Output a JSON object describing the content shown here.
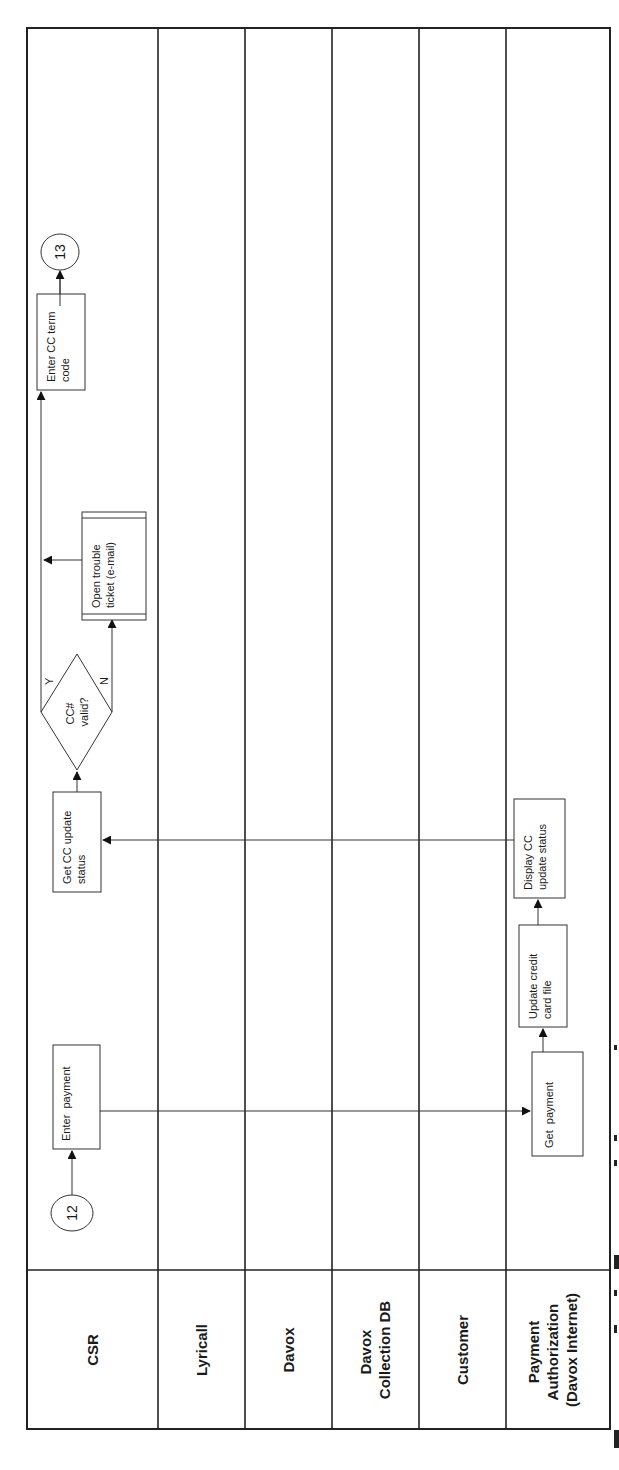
{
  "diagram": {
    "type": "cross-functional swimlane flowchart",
    "orientation": "rotated 90 degrees counter-clockwise",
    "lanes": [
      {
        "id": "csr",
        "label_lines": [
          "CSR"
        ]
      },
      {
        "id": "lyricall",
        "label_lines": [
          "Lyricall"
        ]
      },
      {
        "id": "davox",
        "label_lines": [
          "Davox"
        ]
      },
      {
        "id": "davox-collection-db",
        "label_lines": [
          "Davox",
          "Collection DB"
        ]
      },
      {
        "id": "customer",
        "label_lines": [
          "Customer"
        ]
      },
      {
        "id": "payment-authorization",
        "label_lines": [
          "Payment",
          "Authorization",
          "(Davox Internet)"
        ]
      }
    ],
    "connectors": {
      "start": {
        "label": "12",
        "lane": "csr"
      },
      "end": {
        "label": "13",
        "lane": "csr"
      }
    },
    "steps": {
      "enter_payment": {
        "lines": [
          "Enter  payment"
        ],
        "lane": "csr"
      },
      "get_payment": {
        "lines": [
          "Get  payment"
        ],
        "lane": "payment-authorization"
      },
      "update_cc_file": {
        "lines": [
          "Update credit",
          "card file"
        ],
        "lane": "payment-authorization"
      },
      "display_cc_status": {
        "lines": [
          "Display CC",
          "update status"
        ],
        "lane": "payment-authorization"
      },
      "get_cc_status": {
        "lines": [
          "Get CC update",
          "status"
        ],
        "lane": "csr"
      },
      "open_trouble_ticket": {
        "lines": [
          "Open trouble",
          "ticket (e-mail)"
        ],
        "lane": "csr"
      },
      "enter_cc_term_code": {
        "lines": [
          "Enter CC term",
          "code"
        ],
        "lane": "csr"
      }
    },
    "decision": {
      "lines": [
        "CC#",
        "valid?"
      ],
      "yes_label": "Y",
      "no_label": "N",
      "lane": "csr"
    },
    "flows": [
      {
        "from": "12",
        "to": "Enter  payment"
      },
      {
        "from": "Enter  payment",
        "to": "Get  payment"
      },
      {
        "from": "Get  payment",
        "to": "Update credit card file"
      },
      {
        "from": "Update credit card file",
        "to": "Display CC update status"
      },
      {
        "from": "Display CC update status",
        "to": "Get CC update status"
      },
      {
        "from": "Get CC update status",
        "to": "CC# valid?"
      },
      {
        "from": "CC# valid?",
        "to": "Enter CC term code",
        "label": "Y"
      },
      {
        "from": "CC# valid?",
        "to": "Open trouble ticket (e-mail)",
        "label": "N"
      },
      {
        "from": "Open trouble ticket (e-mail)",
        "to": "Enter CC term code"
      },
      {
        "from": "Enter CC term code",
        "to": "13"
      }
    ],
    "colors": {
      "background": "#ffffff",
      "lines": "#222222",
      "text": "#1a1a1a"
    }
  }
}
